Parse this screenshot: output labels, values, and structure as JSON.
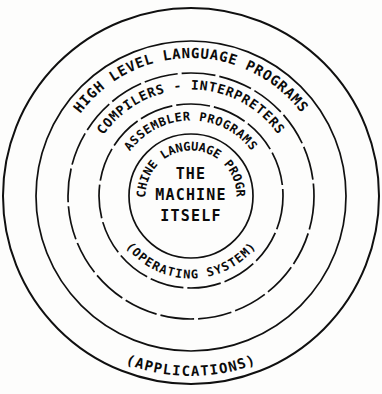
{
  "diagram": {
    "style": {
      "background": "#fdfdfc",
      "stroke": "#101010",
      "text_color": "#0b0b0b"
    },
    "center": {
      "cx": 191,
      "cy": 196
    },
    "rings": [
      {
        "id": "ring-applications",
        "label": "(APPLICATIONS)",
        "radius": 188,
        "dashed": false,
        "label_position": "bottom",
        "font_size": 14,
        "letter_spacing": 1.0
      },
      {
        "id": "ring-high-level-language",
        "label": "HIGH LEVEL LANGUAGE PROGRAMS",
        "radius": 155,
        "dashed": false,
        "label_position": "top",
        "font_size": 14,
        "letter_spacing": 1.0
      },
      {
        "id": "ring-compilers-interpreters",
        "label": "COMPILERS - INTERPRETERS",
        "radius": 123,
        "dashed": true,
        "label_position": "top",
        "font_size": 13,
        "letter_spacing": 1.0
      },
      {
        "id": "ring-assembler-programs",
        "label": "ASSEMBLER PROGRAMS",
        "radius": 92,
        "dashed": true,
        "label_position": "top",
        "font_size": 12,
        "letter_spacing": 1.0
      },
      {
        "id": "ring-machine-language",
        "label": "MACHINE LANGUAGE PROGRAM",
        "radius": 62,
        "dashed": false,
        "label_position": "top",
        "font_size": 12,
        "letter_spacing": 0.6
      }
    ],
    "secondary_label": {
      "id": "label-operating-system",
      "text": "(OPERATING SYSTEM)",
      "radius": 92,
      "label_position": "bottom",
      "font_size": 12,
      "letter_spacing": 0.8
    },
    "core": {
      "id": "core-machine-itself",
      "lines": [
        "THE",
        "MACHINE",
        "ITSELF"
      ]
    }
  }
}
